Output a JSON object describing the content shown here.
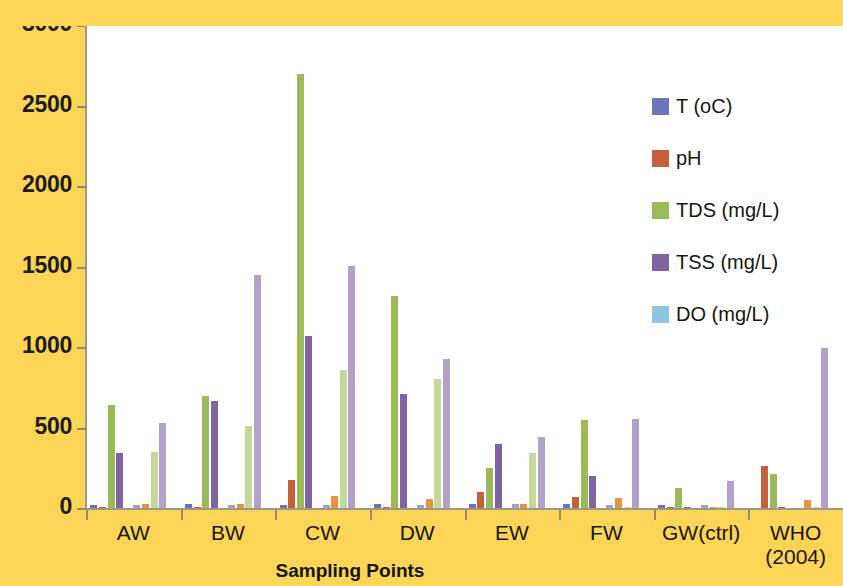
{
  "chart_data": {
    "type": "bar",
    "title": "",
    "xlabel": "Sampling Points",
    "ylabel": "",
    "ylim": [
      0,
      3000
    ],
    "ytick_step": 500,
    "yticks": [
      0,
      500,
      1000,
      1500,
      2000,
      2500,
      3000
    ],
    "grid": false,
    "legend_position": "right",
    "categories": [
      "AW",
      "BW",
      "CW",
      "DW",
      "EW",
      "FW",
      "GW(ctrl)",
      "WHO (2004)"
    ],
    "category_labels_line2": [
      "",
      "",
      "",
      "",
      "",
      "",
      "",
      "(2004)"
    ],
    "sub_groups": [
      "Season 1",
      "Season 2"
    ],
    "legend": [
      "T (oC)",
      "pH",
      "TDS (mg/L)",
      "TSS (mg/L)",
      "DO (mg/L)"
    ],
    "series": [
      {
        "name": "T (oC)",
        "color": "#6b76b8",
        "color_alt": "#9aa2cf",
        "values_s1": [
          28,
          29,
          28,
          29,
          30,
          30,
          27,
          0
        ],
        "values_s2": [
          27,
          28,
          27,
          28,
          29,
          28,
          26,
          0
        ]
      },
      {
        "name": "pH",
        "color": "#c4603a",
        "color_alt": "#e8953f",
        "values_s1": [
          7.1,
          7.0,
          180,
          7.2,
          105,
          75,
          7.0,
          265
        ],
        "values_s2": [
          30,
          32,
          78,
          62,
          33,
          70,
          12,
          55
        ]
      },
      {
        "name": "TDS (mg/L)",
        "color": "#9bbb59",
        "color_alt": "#c5d79a",
        "values_s1": [
          645,
          700,
          2700,
          1325,
          255,
          555,
          130,
          215
        ],
        "values_s2": [
          355,
          515,
          865,
          805,
          345,
          10,
          8,
          10
        ]
      },
      {
        "name": "TSS (mg/L)",
        "color": "#8064a2",
        "color_alt": "#b3a2c7",
        "values_s1": [
          350,
          670,
          1075,
          715,
          405,
          205,
          12,
          14
        ],
        "values_s2": [
          535,
          1455,
          1510,
          930,
          450,
          560,
          175,
          1000
        ]
      },
      {
        "name": "DO (mg/L)",
        "color": "#8cc6e0",
        "color_alt": "#bcdff0",
        "values_s1": [
          0,
          0,
          0,
          0,
          0,
          0,
          0,
          0
        ],
        "values_s2": [
          0,
          0,
          0,
          0,
          0,
          0,
          0,
          0
        ]
      }
    ]
  },
  "axis": {
    "y_labels": [
      "3000",
      "2500",
      "2000",
      "1500",
      "1000",
      "500",
      "0"
    ],
    "x_title": "Sampling Points",
    "x_labels": [
      {
        "line1": "AW",
        "line2": ""
      },
      {
        "line1": "BW",
        "line2": ""
      },
      {
        "line1": "CW",
        "line2": ""
      },
      {
        "line1": "DW",
        "line2": ""
      },
      {
        "line1": "EW",
        "line2": ""
      },
      {
        "line1": "FW",
        "line2": ""
      },
      {
        "line1": "GW(ctrl)",
        "line2": ""
      },
      {
        "line1": "WHO",
        "line2": "(2004)"
      }
    ]
  },
  "legend": {
    "items": [
      {
        "label": "T (oC)",
        "color": "#6b76b8"
      },
      {
        "label": "pH",
        "color": "#c4603a"
      },
      {
        "label": "TDS (mg/L)",
        "color": "#9bbb59"
      },
      {
        "label": "TSS (mg/L)",
        "color": "#8064a2"
      },
      {
        "label": "DO (mg/L)",
        "color": "#8cc6e0"
      }
    ]
  },
  "colors": {
    "background": "#fcd456",
    "plot_background": "#ffffff",
    "axis": "#9a9a86",
    "text": "#161612"
  }
}
